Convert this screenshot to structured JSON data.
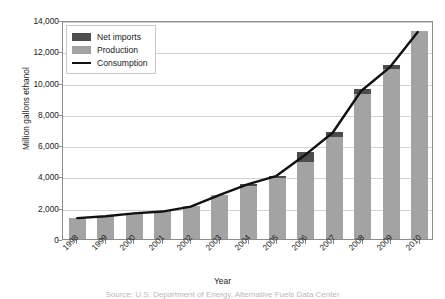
{
  "chart_data": {
    "type": "bar",
    "title": "",
    "xlabel": "Year",
    "ylabel": "Million gallons ethanol",
    "categories": [
      "1998",
      "1999",
      "2000",
      "2001",
      "2002",
      "2003",
      "2004",
      "2005",
      "2006",
      "2007",
      "2008",
      "2009",
      "2010"
    ],
    "ylim": [
      0,
      14000
    ],
    "yticks": [
      0,
      2000,
      4000,
      6000,
      8000,
      10000,
      12000,
      14000
    ],
    "ytick_labels": [
      "0",
      "2,000",
      "4,000",
      "6,000",
      "8,000",
      "10,000",
      "12,000",
      "14,000"
    ],
    "grid": true,
    "legend_position": "upper-left",
    "stacked": true,
    "series": [
      {
        "name": "Production",
        "kind": "bar",
        "color": "#a3a3a3",
        "values": [
          1350,
          1470,
          1630,
          1770,
          2130,
          2800,
          3400,
          3900,
          4900,
          6500,
          9300,
          10900,
          13300
        ]
      },
      {
        "name": "Net imports",
        "kind": "bar",
        "color": "#4d4d4d",
        "values": [
          0,
          0,
          0,
          0,
          0,
          0,
          110,
          140,
          650,
          350,
          320,
          200,
          0
        ]
      },
      {
        "name": "Consumption",
        "kind": "line",
        "color": "#111111",
        "values": [
          1350,
          1470,
          1650,
          1770,
          2085,
          2830,
          3530,
          4050,
          5380,
          6850,
          9550,
          11050,
          13350
        ]
      }
    ]
  },
  "legend": {
    "items": [
      {
        "label": "Net imports",
        "swatch": "dark-gray-square"
      },
      {
        "label": "Production",
        "swatch": "medium-gray-square"
      },
      {
        "label": "Consumption",
        "swatch": "black-line"
      }
    ]
  },
  "caption": {
    "text": "Source: U.S. Department of Energy, Alternative Fuels Data Center"
  }
}
